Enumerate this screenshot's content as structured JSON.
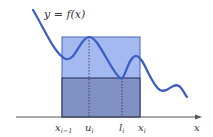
{
  "diagram": {
    "function_label": "y = f(x)",
    "axis_label": "x",
    "tick_labels": {
      "x_prev": "x",
      "x_prev_sub": "i−1",
      "u": "u",
      "u_sub": "i",
      "l": "l",
      "l_sub": "i",
      "x_i": "x",
      "x_i_sub": "i"
    },
    "colors": {
      "upper_rect": "#9db4ee",
      "lower_rect": "#7d8fc0",
      "curve": "#3a5cc4",
      "axis": "#444444",
      "rect_border": "#2a3d7a"
    }
  }
}
